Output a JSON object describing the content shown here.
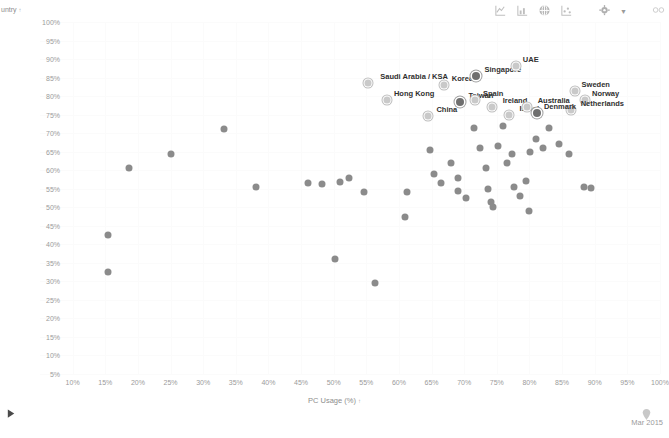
{
  "toolbar": {
    "icons": [
      {
        "name": "line-chart-icon",
        "glyph": "line"
      },
      {
        "name": "bar-chart-icon",
        "glyph": "bar"
      },
      {
        "name": "globe-icon",
        "glyph": "globe"
      },
      {
        "name": "scatter-chart-icon",
        "glyph": "scatter"
      },
      {
        "name": "settings-gear-icon",
        "glyph": "gear"
      },
      {
        "name": "dropdown-caret-icon",
        "glyph": "caret"
      },
      {
        "name": "link-infinity-icon",
        "glyph": "infinity"
      }
    ]
  },
  "footer": {
    "play_label": "▶",
    "date": "Mar 2015"
  },
  "chart_data": {
    "type": "scatter",
    "title": "",
    "xlabel": "PC Usage (%)",
    "ylabel": "untry",
    "xlim": [
      5,
      100
    ],
    "ylim": [
      5,
      100
    ],
    "grid": true,
    "legend": "none",
    "sort_indicator": "↑",
    "xticks": [
      "10%",
      "15%",
      "20%",
      "25%",
      "30%",
      "35%",
      "40%",
      "45%",
      "50%",
      "55%",
      "60%",
      "65%",
      "70%",
      "75%",
      "80%",
      "85%",
      "90%",
      "95%",
      "100%"
    ],
    "yticks": [
      "100%",
      "95%",
      "90%",
      "85%",
      "80%",
      "75%",
      "70%",
      "65%",
      "60%",
      "55%",
      "50%",
      "45%",
      "40%",
      "35%",
      "30%",
      "25%",
      "20%",
      "15%",
      "10%",
      "5%"
    ],
    "points": [
      {
        "label": "",
        "x": 15.4,
        "y": 42.5,
        "style": "plain"
      },
      {
        "label": "",
        "x": 15.4,
        "y": 32.5,
        "style": "plain"
      },
      {
        "label": "",
        "x": 18.7,
        "y": 60.5,
        "style": "plain"
      },
      {
        "label": "",
        "x": 25.1,
        "y": 64.5,
        "style": "plain"
      },
      {
        "label": "",
        "x": 33.2,
        "y": 71.0,
        "style": "plain"
      },
      {
        "label": "",
        "x": 38.1,
        "y": 55.5,
        "style": "plain"
      },
      {
        "label": "",
        "x": 46.0,
        "y": 56.5,
        "style": "plain"
      },
      {
        "label": "",
        "x": 48.2,
        "y": 56.3,
        "style": "plain"
      },
      {
        "label": "",
        "x": 51.0,
        "y": 56.8,
        "style": "plain"
      },
      {
        "label": "",
        "x": 52.4,
        "y": 57.8,
        "style": "plain"
      },
      {
        "label": "",
        "x": 54.6,
        "y": 54.0,
        "style": "plain"
      },
      {
        "label": "",
        "x": 50.2,
        "y": 36.0,
        "style": "plain"
      },
      {
        "label": "",
        "x": 56.4,
        "y": 29.5,
        "style": "plain"
      },
      {
        "label": "",
        "x": 61.2,
        "y": 54.0,
        "style": "plain"
      },
      {
        "label": "",
        "x": 61.0,
        "y": 47.5,
        "style": "plain"
      },
      {
        "label": "Hong Kong",
        "x": 58.2,
        "y": 79.0,
        "style": "ring"
      },
      {
        "label": "Saudi Arabia / KSA",
        "x": 55.3,
        "y": 83.5,
        "style": "ring"
      },
      {
        "label": "China",
        "x": 64.5,
        "y": 74.5,
        "style": "ring"
      },
      {
        "label": "Korea",
        "x": 66.9,
        "y": 83.0,
        "style": "ring"
      },
      {
        "label": "Taiwan",
        "x": 69.4,
        "y": 78.5,
        "style": "hl"
      },
      {
        "label": "Singapore",
        "x": 71.8,
        "y": 85.5,
        "style": "hl"
      },
      {
        "label": "Spain",
        "x": 71.6,
        "y": 79.0,
        "style": "ring"
      },
      {
        "label": "Ireland",
        "x": 74.3,
        "y": 77.0,
        "style": "ring"
      },
      {
        "label": "UAE",
        "x": 78.0,
        "y": 88.0,
        "style": "ring"
      },
      {
        "label": "Israel",
        "x": 76.8,
        "y": 75.0,
        "style": "ring"
      },
      {
        "label": "Australia",
        "x": 79.6,
        "y": 77.0,
        "style": "ring"
      },
      {
        "label": "Sweden",
        "x": 87.0,
        "y": 81.5,
        "style": "ring"
      },
      {
        "label": "Norway",
        "x": 88.5,
        "y": 79.0,
        "style": "ring"
      },
      {
        "label": "Netherlands",
        "x": 86.4,
        "y": 76.2,
        "style": "ring"
      },
      {
        "label": "Denmark",
        "x": 81.2,
        "y": 75.5,
        "style": "hl"
      },
      {
        "label": "",
        "x": 64.8,
        "y": 65.5,
        "style": "plain"
      },
      {
        "label": "",
        "x": 65.3,
        "y": 59.0,
        "style": "plain"
      },
      {
        "label": "",
        "x": 66.5,
        "y": 56.5,
        "style": "plain"
      },
      {
        "label": "",
        "x": 68.0,
        "y": 62.0,
        "style": "plain"
      },
      {
        "label": "",
        "x": 69.1,
        "y": 58.0,
        "style": "plain"
      },
      {
        "label": "",
        "x": 69.0,
        "y": 54.5,
        "style": "plain"
      },
      {
        "label": "",
        "x": 70.3,
        "y": 52.5,
        "style": "plain"
      },
      {
        "label": "",
        "x": 71.5,
        "y": 71.5,
        "style": "plain"
      },
      {
        "label": "",
        "x": 72.4,
        "y": 66.0,
        "style": "plain"
      },
      {
        "label": "",
        "x": 73.3,
        "y": 60.5,
        "style": "plain"
      },
      {
        "label": "",
        "x": 73.6,
        "y": 55.0,
        "style": "plain"
      },
      {
        "label": "",
        "x": 74.1,
        "y": 51.5,
        "style": "plain"
      },
      {
        "label": "",
        "x": 74.4,
        "y": 50.0,
        "style": "plain"
      },
      {
        "label": "",
        "x": 75.2,
        "y": 66.5,
        "style": "plain"
      },
      {
        "label": "",
        "x": 75.9,
        "y": 72.0,
        "style": "plain"
      },
      {
        "label": "",
        "x": 76.5,
        "y": 62.0,
        "style": "plain"
      },
      {
        "label": "",
        "x": 77.3,
        "y": 64.5,
        "style": "plain"
      },
      {
        "label": "",
        "x": 77.6,
        "y": 55.5,
        "style": "plain"
      },
      {
        "label": "",
        "x": 78.5,
        "y": 53.0,
        "style": "plain"
      },
      {
        "label": "",
        "x": 79.4,
        "y": 57.0,
        "style": "plain"
      },
      {
        "label": "",
        "x": 80.1,
        "y": 65.0,
        "style": "plain"
      },
      {
        "label": "",
        "x": 81.0,
        "y": 68.5,
        "style": "plain"
      },
      {
        "label": "",
        "x": 82.1,
        "y": 66.0,
        "style": "plain"
      },
      {
        "label": "",
        "x": 83.0,
        "y": 71.5,
        "style": "plain"
      },
      {
        "label": "",
        "x": 84.5,
        "y": 67.0,
        "style": "plain"
      },
      {
        "label": "",
        "x": 86.0,
        "y": 64.5,
        "style": "plain"
      },
      {
        "label": "",
        "x": 88.4,
        "y": 55.5,
        "style": "plain"
      },
      {
        "label": "",
        "x": 89.4,
        "y": 55.3,
        "style": "plain"
      },
      {
        "label": "",
        "x": 79.9,
        "y": 49.0,
        "style": "plain"
      }
    ]
  }
}
